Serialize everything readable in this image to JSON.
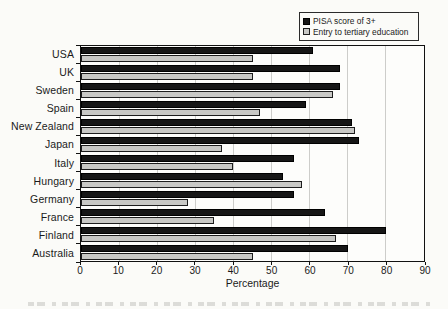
{
  "page": {
    "background": "#fbfbf8"
  },
  "legend": {
    "position": "top-right",
    "items": [
      {
        "key": "pisa",
        "label": "PISA score of 3+",
        "swatch_color": "#161616",
        "swatch_border": "#000000"
      },
      {
        "key": "entry",
        "label": "Entry to tertiary education",
        "swatch_color": "#c8c8c5",
        "swatch_border": "#1d1d1d"
      }
    ]
  },
  "x_axis": {
    "title": "Percentage",
    "ticks": [
      "0",
      "10",
      "20",
      "30",
      "40",
      "50",
      "60",
      "70",
      "80",
      "90"
    ]
  },
  "chart_data": {
    "type": "bar",
    "orientation": "horizontal",
    "title": "",
    "categories": [
      "USA",
      "UK",
      "Sweden",
      "Spain",
      "New Zealand",
      "Japan",
      "Italy",
      "Hungary",
      "Germany",
      "France",
      "Finland",
      "Australia"
    ],
    "series": [
      {
        "name": "PISA score of 3+",
        "key": "pisa",
        "color": "#161616",
        "values": [
          61,
          68,
          68,
          59,
          71,
          73,
          56,
          53,
          56,
          64,
          80,
          70
        ]
      },
      {
        "name": "Entry to tertiary education",
        "key": "entry",
        "color": "#c8c8c5",
        "values": [
          45,
          45,
          66,
          47,
          72,
          37,
          40,
          58,
          28,
          35,
          67,
          45
        ]
      }
    ],
    "xlabel": "Percentage",
    "xlim": [
      0,
      90
    ],
    "x_tick_interval": 10,
    "grid": "vertical",
    "legend_position": "top-right",
    "colors": {
      "gridline": "#cdcdca",
      "plot_border": "#111111",
      "text": "#1a1a1a"
    }
  }
}
